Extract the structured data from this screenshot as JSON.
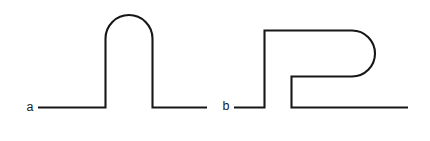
{
  "figure": {
    "background_color": "#ffffff",
    "stroke_color": "#161616",
    "stroke_width": 2.1,
    "width": 430,
    "height": 141,
    "shapes": [
      {
        "id": "a",
        "label": "a",
        "label_x": 30,
        "label_y": 111,
        "name": "arch-curve",
        "description": "Horizontal baseline that rises into a tall rounded arch (semicircular cap) and returns to the baseline",
        "path": "M 38 107.5 L 105.5 107.5 L 105.5 38.5 A 23.5 23.5 0 0 1 152.5 38.5 L 152.5 107.5 L 207 107.5"
      },
      {
        "id": "b",
        "label": "b",
        "label_x": 226,
        "label_y": 110,
        "name": "hook-curve",
        "description": "Horizontal baseline that rises, runs right along the top, curves down and back in a rounded hook, then returns left and down to rejoin a baseline that crosses beneath it",
        "path": "M 234 107.5 L 264.5 107.5 L 264.5 30.5 L 352 30.5 A 23 23 0 0 1 352 76.5 L 291.5 76.5 L 291.5 107.5 L 408 107.5"
      }
    ]
  }
}
